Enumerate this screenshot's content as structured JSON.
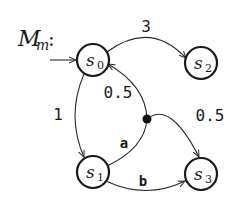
{
  "diagram": {
    "title": "M",
    "title_subscript": "m",
    "title_suffix": ":",
    "nodes": [
      {
        "id": "s0",
        "label": "s",
        "subscript": "0",
        "initial": true
      },
      {
        "id": "s1",
        "label": "s",
        "subscript": "1"
      },
      {
        "id": "s2",
        "label": "s",
        "subscript": "2"
      },
      {
        "id": "s3",
        "label": "s",
        "subscript": "3"
      }
    ],
    "edges": [
      {
        "from": "s0",
        "to": "s2",
        "label": "3"
      },
      {
        "from": "s0",
        "to": "s1",
        "label": "1"
      },
      {
        "from": "s1",
        "to": "branch",
        "label": "a"
      },
      {
        "from": "branch",
        "to": "s0",
        "label": "0.5"
      },
      {
        "from": "branch",
        "to": "s3",
        "label": "0.5"
      },
      {
        "from": "s1",
        "to": "s3",
        "label": "b"
      }
    ],
    "colors": {
      "stroke": "#1a1a1a",
      "background": "#ffffff"
    }
  }
}
